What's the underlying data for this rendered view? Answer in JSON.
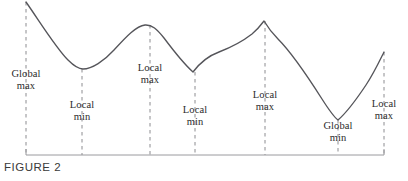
{
  "figure": {
    "caption": "FIGURE 2",
    "curve_color": "#55555a",
    "dash_color": "#8c8c90",
    "axis_color": "#9a9a9e",
    "text_color": "#2b2b2b",
    "width": 408,
    "height": 181
  },
  "chart_data": {
    "type": "line",
    "title": "FIGURE 2",
    "xlabel": "",
    "ylabel": "",
    "grid": false,
    "legend": false,
    "axis": {
      "baseline_y": 155,
      "x_start": 26,
      "x_end": 384,
      "end_tick_height": 6
    },
    "curve_path": "M 26,2 C 40,22 56,48 68,60 C 75,67 79,69 83,69 C 92,69 104,61 114,50 C 126,37 136,26 145,25 C 152,24.5 157,29 164,38 C 173,50 184,64 193,72 C 199,64 208,56 219,52 C 232,47 243,41 252,34 C 258,29 261,25 264,21 C 267,26 271,32 278,39 C 290,51 308,77 322,99 C 329,110 334,117 338,120 C 345,114 356,100 366,85 C 374,73 380,60 384,52",
    "annotations": [
      {
        "id": "global-max",
        "line1": "Global",
        "line2": "max",
        "x": 26,
        "label_y": 68,
        "point_x": 26,
        "point_y": 2,
        "dash_from_y": 2,
        "dash_to_y": 155,
        "kind": "global-max"
      },
      {
        "id": "local-min-1",
        "line1": "Local",
        "line2": "min",
        "x": 82,
        "label_y": 99,
        "point_x": 82,
        "point_y": 69,
        "dash_from_y": 69,
        "dash_to_y": 155,
        "kind": "local-min"
      },
      {
        "id": "local-max-1",
        "line1": "Local",
        "line2": "max",
        "x": 150,
        "label_y": 62,
        "point_x": 145,
        "point_y": 25,
        "dash_from_y": 25,
        "dash_to_y": 155,
        "kind": "local-max"
      },
      {
        "id": "local-min-2",
        "line1": "Local",
        "line2": "min",
        "x": 195,
        "label_y": 104,
        "point_x": 193,
        "point_y": 72,
        "dash_from_y": 72,
        "dash_to_y": 155,
        "kind": "local-min"
      },
      {
        "id": "local-max-2",
        "line1": "Local",
        "line2": "max",
        "x": 265,
        "label_y": 89,
        "point_x": 264,
        "point_y": 21,
        "dash_from_y": 21,
        "dash_to_y": 155,
        "kind": "local-max"
      },
      {
        "id": "global-min",
        "line1": "Global",
        "line2": "min",
        "x": 338,
        "label_y": 120,
        "point_x": 338,
        "point_y": 120,
        "dash_from_y": 120,
        "dash_to_y": 155,
        "kind": "global-min"
      },
      {
        "id": "local-max-3",
        "line1": "Local",
        "line2": "max",
        "x": 384,
        "label_y": 98,
        "point_x": 384,
        "point_y": 52,
        "dash_from_y": 52,
        "dash_to_y": 155,
        "kind": "local-max"
      }
    ]
  }
}
